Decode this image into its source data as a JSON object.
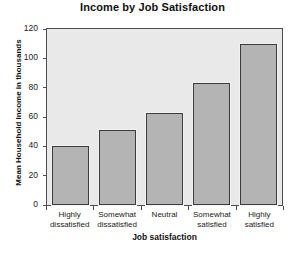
{
  "chart_data": {
    "type": "bar",
    "title": "Income by Job Satisfaction",
    "xlabel": "Job satisfaction",
    "ylabel": "Mean Household Income in thousands",
    "categories": [
      "Highly dissatisfied",
      "Somewhat dissatisfied",
      "Neutral",
      "Somewhat satisfied",
      "Highly satisfied"
    ],
    "category_lines": [
      [
        "Highly",
        "dissatisfied"
      ],
      [
        "Somewhat",
        "dissatisfied"
      ],
      [
        "Neutral",
        ""
      ],
      [
        "Somewhat",
        "satisfied"
      ],
      [
        "Highly",
        "satisfied"
      ]
    ],
    "values": [
      40,
      51,
      63,
      83,
      110
    ],
    "ylim": [
      0,
      120
    ],
    "yticks": [
      0,
      20,
      40,
      60,
      80,
      100,
      120
    ],
    "ytick_labels": [
      "0",
      "20",
      "40",
      "60",
      "80",
      "100",
      "120"
    ],
    "grid": false,
    "legend": "none",
    "colors": {
      "bar_fill": "#b4b4b4",
      "bar_border": "#3c3c3c",
      "plot_background": "#e9e9e9",
      "plot_border": "#4d4d4d",
      "page_background": "#ffffff",
      "text": "#111111"
    }
  }
}
